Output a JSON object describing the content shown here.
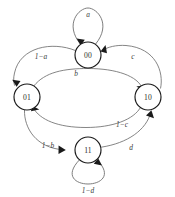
{
  "diagram": {
    "type": "state-transition-diagram",
    "background_color": "#ffffff",
    "node_stroke_color": "#1a1a1a",
    "edge_stroke_color": "#6f6f6f",
    "label_color": "#3a3a3a",
    "nodes": [
      {
        "id": "s00",
        "label": "00",
        "cx": 88,
        "cy": 55,
        "r": 13
      },
      {
        "id": "s01",
        "label": "01",
        "cx": 27,
        "cy": 97,
        "r": 13
      },
      {
        "id": "s10",
        "label": "10",
        "cx": 148,
        "cy": 97,
        "r": 13
      },
      {
        "id": "s11",
        "label": "11",
        "cx": 88,
        "cy": 150,
        "r": 13
      }
    ],
    "edges": [
      {
        "id": "e-a",
        "label": "a",
        "from": "s00",
        "to": "s00",
        "kind": "self-loop",
        "label_x": 88,
        "label_y": 14
      },
      {
        "id": "e-1ma",
        "label": "1−a",
        "from": "s00",
        "to": "s01",
        "kind": "curve",
        "label_x": 41,
        "label_y": 56
      },
      {
        "id": "e-c",
        "label": "c",
        "from": "s10",
        "to": "s00",
        "kind": "curve",
        "label_x": 133,
        "label_y": 56
      },
      {
        "id": "e-b",
        "label": "b",
        "from": "s01",
        "to": "s10",
        "kind": "curve",
        "label_x": 76,
        "label_y": 73
      },
      {
        "id": "e-1mc",
        "label": "1−c",
        "from": "s10",
        "to": "s01",
        "kind": "curve",
        "label_x": 122,
        "label_y": 124
      },
      {
        "id": "e-1mb",
        "label": "1−b",
        "from": "s01",
        "to": "s11",
        "kind": "curve",
        "label_x": 48,
        "label_y": 145
      },
      {
        "id": "e-d",
        "label": "d",
        "from": "s11",
        "to": "s10",
        "kind": "curve",
        "label_x": 131,
        "label_y": 147
      },
      {
        "id": "e-1md",
        "label": "1−d",
        "from": "s11",
        "to": "s11",
        "kind": "self-loop",
        "label_x": 88,
        "label_y": 190
      }
    ]
  }
}
